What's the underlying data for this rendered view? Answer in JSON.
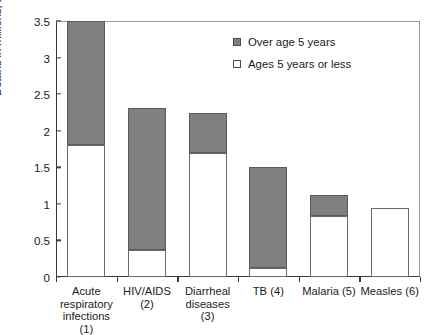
{
  "chart_data": {
    "type": "bar",
    "subtype": "stacked-vertical",
    "title": "",
    "xlabel": "",
    "ylabel": "Deaths in millions, all ages",
    "ylim": [
      0,
      3.5
    ],
    "yticks": [
      "0",
      "0.5",
      "1",
      "1.5",
      "2",
      "2.5",
      "3",
      "3.5"
    ],
    "ytick_values": [
      0,
      0.5,
      1,
      1.5,
      2,
      2.5,
      3,
      3.5
    ],
    "grid": false,
    "legend_position": "top-right",
    "categories": [
      "Acute respiratory infections (1)",
      "HIV/AIDS (2)",
      "Diarrheal diseases (3)",
      "TB (4)",
      "Malaria (5)",
      "Measles (6)"
    ],
    "category_lines": [
      [
        "Acute",
        "respiratory",
        "infections (1)"
      ],
      [
        "HIV/AIDS (2)"
      ],
      [
        "Diarrheal",
        "diseases (3)"
      ],
      [
        "TB (4)"
      ],
      [
        "Malaria (5)"
      ],
      [
        "Measles (6)"
      ]
    ],
    "series": [
      {
        "name": "Ages 5 years or less",
        "color": "#ffffff",
        "values": [
          1.8,
          0.37,
          1.7,
          0.12,
          0.83,
          0.94
        ]
      },
      {
        "name": "Over age 5 years",
        "color": "#808080",
        "values": [
          1.7,
          1.94,
          0.54,
          1.38,
          0.29,
          0.0
        ]
      }
    ],
    "totals": [
      3.5,
      2.31,
      2.24,
      1.5,
      1.12,
      0.94
    ],
    "legend": [
      {
        "label": "Over age 5 years",
        "swatch": "filled",
        "color": "#808080"
      },
      {
        "label": "Ages 5 years or less",
        "swatch": "open",
        "color": "#ffffff"
      }
    ]
  },
  "colors": {
    "over_age_five": "#808080",
    "ages_five_or_less": "#ffffff",
    "axis": "#3a3a3a",
    "text": "#1a1a1a",
    "background": "#ffffff"
  }
}
